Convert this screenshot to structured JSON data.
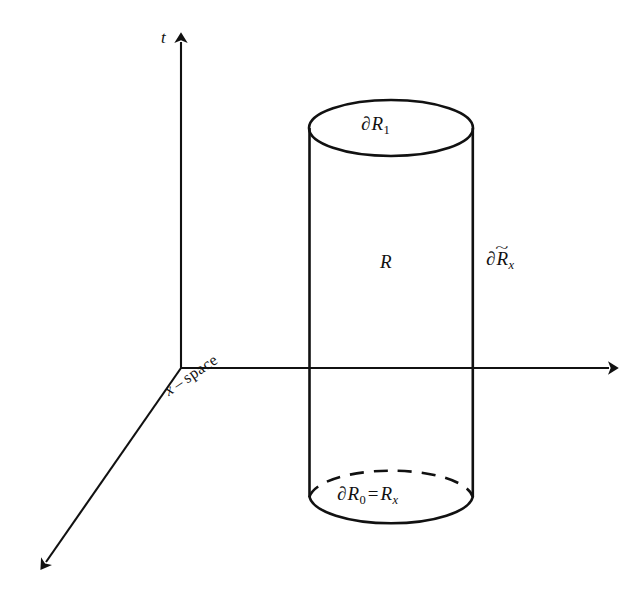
{
  "figure": {
    "name": "cylinder-region-spacetime-diagram",
    "background_color": "#ffffff",
    "stroke_color": "#111111",
    "axes": {
      "origin": {
        "x": 181,
        "y": 368
      },
      "vertical_axis": {
        "label": "t",
        "from": {
          "x": 181,
          "y": 368
        },
        "to": {
          "x": 181,
          "y": 32
        },
        "arrow": true
      },
      "horizontal_axis": {
        "label": "",
        "from": {
          "x": 181,
          "y": 368
        },
        "to": {
          "x": 620,
          "y": 368
        },
        "arrow": true
      },
      "diagonal_axis": {
        "label": "x - space",
        "label_parts": {
          "var": "x",
          "dash": "–",
          "word": "space"
        },
        "from": {
          "x": 181,
          "y": 368
        },
        "to": {
          "x": 37,
          "y": 575
        },
        "arrow": true,
        "label_rotation_deg": -34
      }
    },
    "cylinder": {
      "left_x": 310,
      "right_x": 473,
      "center_x": 391,
      "radius_x": 82,
      "top": {
        "center_y": 128,
        "radius_y": 28,
        "style": "solid"
      },
      "bottom": {
        "center_y": 497,
        "radius_y": 29,
        "front_style": "solid",
        "back_style": "dashed",
        "dash_pattern": "14 10"
      }
    },
    "labels": {
      "t": {
        "text": "t",
        "italic": true
      },
      "top_boundary": {
        "partial": "∂",
        "symbol": "R",
        "subscript": "1",
        "subscript_kind": "number",
        "plain": "∂R₁"
      },
      "region": {
        "symbol": "R",
        "plain": "R"
      },
      "lateral_boundary": {
        "partial": "∂",
        "symbol": "R",
        "accent": "~",
        "subscript": "x",
        "subscript_kind": "variable",
        "plain": "∂R̃ₓ"
      },
      "bottom_boundary": {
        "partial": "∂",
        "symbol": "R",
        "subscript": "0",
        "subscript_kind": "number",
        "equals": "=",
        "rhs_symbol": "R",
        "rhs_subscript": "x",
        "plain": "∂R₀ = Rₓ"
      },
      "x_space": {
        "plain": "x - space"
      }
    }
  }
}
